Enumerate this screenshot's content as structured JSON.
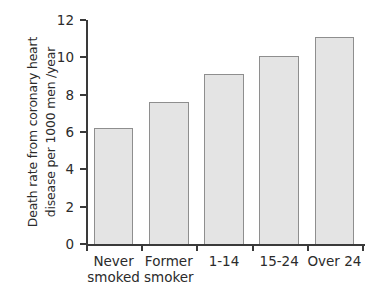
{
  "chart_data": {
    "type": "bar",
    "title": "",
    "subtitle": "",
    "xlabel": "",
    "ylabel": "Death rate from coronary heart disease per 1000 men /year",
    "ylabel_lines": [
      "Death rate from coronary heart",
      "disease per 1000 men /year"
    ],
    "categories": [
      "Never\nsmoked",
      "Former\nsmoker",
      "1-14",
      "15-24",
      "Over 24"
    ],
    "values": [
      6.2,
      7.6,
      9.1,
      10.05,
      11.1
    ],
    "ylim": [
      0,
      12
    ],
    "ytick_labels": [
      "0",
      "2",
      "4",
      "6",
      "8",
      "10",
      "12"
    ],
    "ytick_values": [
      0,
      2,
      4,
      6,
      8,
      10,
      12
    ],
    "grid": false,
    "legend": null,
    "legend_position": "none",
    "annotations": [],
    "colors": {
      "bar_fill": "#e4e4e4",
      "bar_stroke": "#8e8e8e",
      "axis": "#3a3a3a",
      "text": "#2b2b2b",
      "background": "#ffffff"
    }
  }
}
